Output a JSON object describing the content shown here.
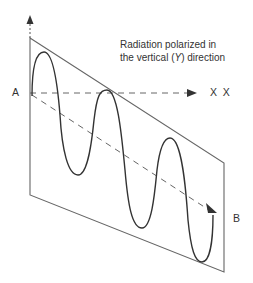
{
  "diagram": {
    "caption_line1": "Radiation polarized in",
    "caption_line2_pre": "the vertical (",
    "caption_line2_axis": "Y",
    "caption_line2_post": ") direction",
    "labels": {
      "start": "A",
      "end": "B",
      "x_marks": "X  X"
    },
    "colors": {
      "line": "#555555",
      "wave": "#333333",
      "text": "#333333"
    }
  }
}
